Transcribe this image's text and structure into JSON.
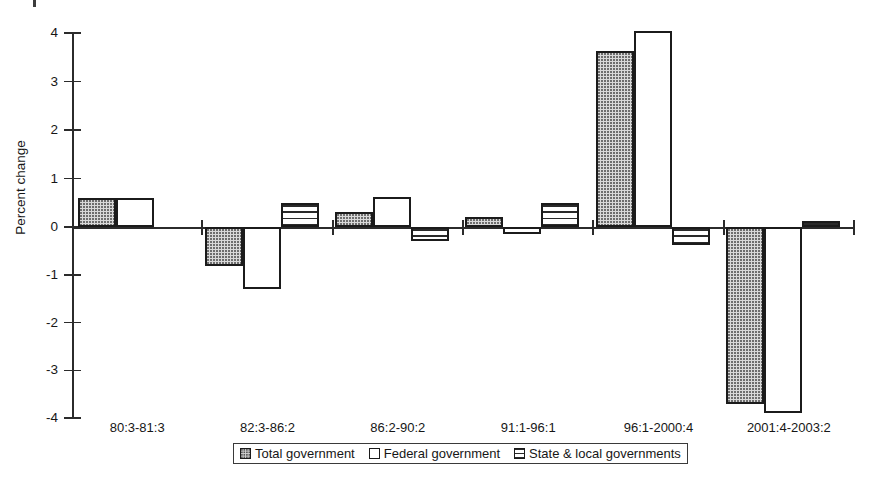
{
  "chart_data": {
    "type": "bar",
    "title": "",
    "subtitle": "",
    "xlabel": "",
    "ylabel": "Percent change",
    "ylim": [
      -4,
      4
    ],
    "yticks": [
      4,
      3,
      2,
      1,
      0,
      -1,
      -2,
      -3,
      -4
    ],
    "ytick_labels": [
      "4",
      "3",
      "2",
      "1",
      "0",
      "-1",
      "-2",
      "-3",
      "-4"
    ],
    "grid": false,
    "legend_position": "bottom",
    "categories": [
      "80:3-81:3",
      "82:3-86:2",
      "86:2-90:2",
      "91:1-96:1",
      "96:1-2000:4",
      "2001:4-2003:2"
    ],
    "series": [
      {
        "name": "Total government",
        "pattern": "dotted",
        "values": [
          0.6,
          -0.82,
          0.3,
          0.2,
          3.63,
          -3.7
        ]
      },
      {
        "name": "Federal government",
        "pattern": "white",
        "values": [
          0.6,
          -1.3,
          0.62,
          -0.15,
          4.05,
          -3.9
        ]
      },
      {
        "name": "State & local governments",
        "pattern": "hlines",
        "values": [
          null,
          0.5,
          -0.3,
          0.5,
          -0.37,
          0.12
        ]
      }
    ]
  },
  "axis": {
    "y_title": "Percent change"
  },
  "legend": {
    "items": [
      {
        "label": "Total government",
        "pattern": "dotted"
      },
      {
        "label": "Federal government",
        "pattern": "white"
      },
      {
        "label": "State & local governments",
        "pattern": "hlines"
      }
    ]
  }
}
